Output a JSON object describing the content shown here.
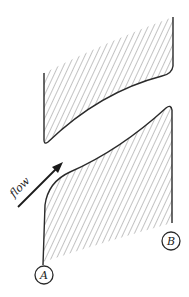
{
  "diagram": {
    "type": "cascade-blade-passage",
    "flow_label": "flow",
    "points": [
      {
        "id": "A",
        "label": "A"
      },
      {
        "id": "B",
        "label": "B"
      }
    ],
    "colors": {
      "outline": "#2a2a2a",
      "hatch": "#6a6a6a",
      "background": "#ffffff"
    }
  }
}
